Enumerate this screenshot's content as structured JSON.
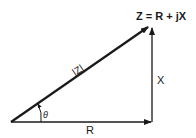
{
  "diagram": {
    "type": "impedance-triangle",
    "labels": {
      "equation": "Z = R + jX",
      "hypotenuse": "|Z|",
      "vertical": "X",
      "horizontal": "R",
      "angle": "θ"
    },
    "colors": {
      "stroke": "#1a1a1a",
      "background": "#ffffff"
    }
  }
}
